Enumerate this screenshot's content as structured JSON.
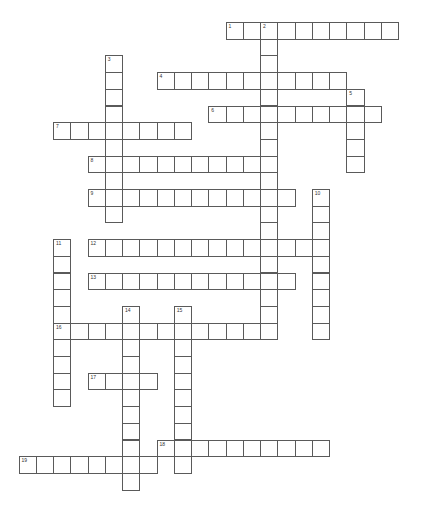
{
  "puzzle": {
    "cell_width": 17.25,
    "cell_height": 16.7,
    "origin_x": 18.5,
    "origin_y": 22,
    "grid_line_color": "#5a5a5a",
    "entries": [
      {
        "number": "1",
        "direction": "across",
        "row": 0,
        "col": 12,
        "length": 10
      },
      {
        "number": "2",
        "direction": "down",
        "row": 0,
        "col": 14,
        "length": 19
      },
      {
        "number": "3",
        "direction": "down",
        "row": 2,
        "col": 5,
        "length": 10
      },
      {
        "number": "4",
        "direction": "across",
        "row": 3,
        "col": 8,
        "length": 11
      },
      {
        "number": "5",
        "direction": "down",
        "row": 4,
        "col": 19,
        "length": 5
      },
      {
        "number": "6",
        "direction": "across",
        "row": 5,
        "col": 11,
        "length": 10
      },
      {
        "number": "7",
        "direction": "across",
        "row": 6,
        "col": 2,
        "length": 8
      },
      {
        "number": "8",
        "direction": "across",
        "row": 8,
        "col": 4,
        "length": 11
      },
      {
        "number": "9",
        "direction": "across",
        "row": 10,
        "col": 4,
        "length": 12
      },
      {
        "number": "10",
        "direction": "down",
        "row": 10,
        "col": 17,
        "length": 9
      },
      {
        "number": "11",
        "direction": "down",
        "row": 13,
        "col": 2,
        "length": 10
      },
      {
        "number": "12",
        "direction": "across",
        "row": 13,
        "col": 4,
        "length": 14
      },
      {
        "number": "13",
        "direction": "across",
        "row": 15,
        "col": 4,
        "length": 12
      },
      {
        "number": "14",
        "direction": "down",
        "row": 17,
        "col": 6,
        "length": 11
      },
      {
        "number": "15",
        "direction": "down",
        "row": 17,
        "col": 9,
        "length": 10
      },
      {
        "number": "16",
        "direction": "across",
        "row": 18,
        "col": 2,
        "length": 13
      },
      {
        "number": "17",
        "direction": "across",
        "row": 21,
        "col": 4,
        "length": 4
      },
      {
        "number": "18",
        "direction": "across",
        "row": 25,
        "col": 8,
        "length": 10
      },
      {
        "number": "19",
        "direction": "across",
        "row": 26,
        "col": 0,
        "length": 8
      }
    ]
  }
}
